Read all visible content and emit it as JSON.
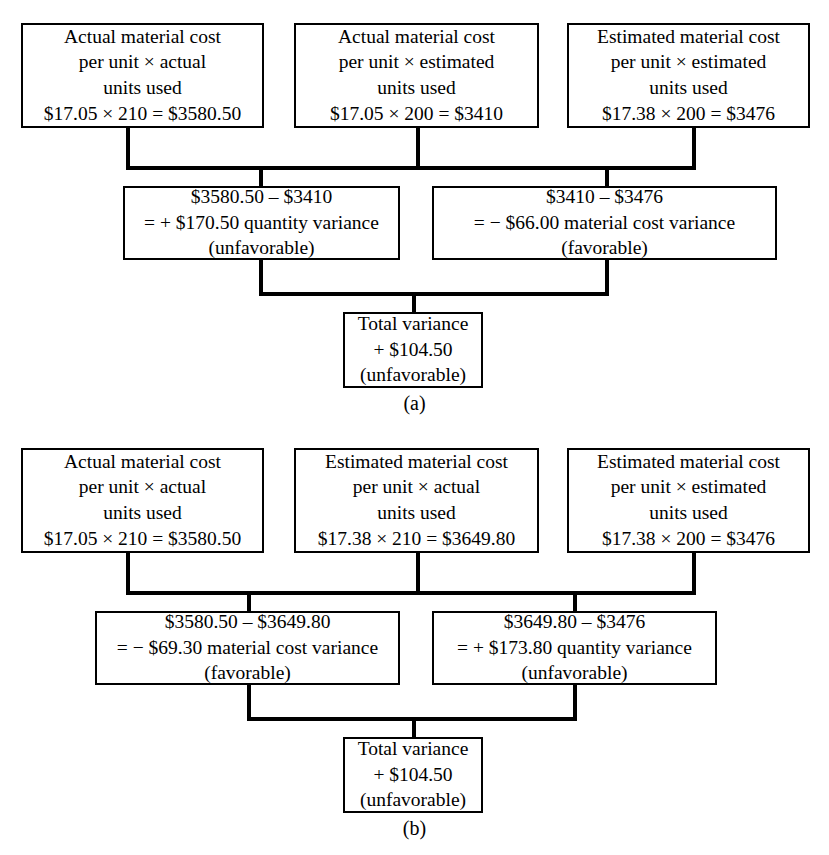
{
  "figure": {
    "panels": [
      {
        "id": "a",
        "label": "(a)",
        "top_row": [
          {
            "name": "actual-cost-actual-units",
            "lines": [
              "Actual material cost",
              "per unit × actual",
              "units used",
              "$17.05 × 210 = $3580.50"
            ]
          },
          {
            "name": "actual-cost-estimated-units",
            "lines": [
              "Actual material cost",
              "per unit × estimated",
              "units used",
              "$17.05 × 200 = $3410"
            ]
          },
          {
            "name": "estimated-cost-estimated-units",
            "lines": [
              "Estimated material cost",
              "per unit × estimated",
              "units used",
              "$17.38 × 200 = $3476"
            ]
          }
        ],
        "middle_row": [
          {
            "name": "quantity-variance",
            "lines": [
              "$3580.50 – $3410",
              "= + $170.50 quantity variance",
              "(unfavorable)"
            ]
          },
          {
            "name": "material-cost-variance",
            "lines": [
              "$3410 – $3476",
              "= − $66.00 material cost variance",
              "(favorable)"
            ]
          }
        ],
        "total": {
          "name": "total-variance",
          "lines": [
            "Total variance",
            "+ $104.50",
            "(unfavorable)"
          ]
        }
      },
      {
        "id": "b",
        "label": "(b)",
        "top_row": [
          {
            "name": "actual-cost-actual-units",
            "lines": [
              "Actual material cost",
              "per unit × actual",
              "units used",
              "$17.05 × 210 = $3580.50"
            ]
          },
          {
            "name": "estimated-cost-actual-units",
            "lines": [
              "Estimated material cost",
              "per unit × actual",
              "units used",
              "$17.38 × 210 = $3649.80"
            ]
          },
          {
            "name": "estimated-cost-estimated-units",
            "lines": [
              "Estimated material cost",
              "per unit × estimated",
              "units used",
              "$17.38 × 200 = $3476"
            ]
          }
        ],
        "middle_row": [
          {
            "name": "material-cost-variance",
            "lines": [
              "$3580.50 – $3649.80",
              "= − $69.30 material cost variance",
              "(favorable)"
            ]
          },
          {
            "name": "quantity-variance",
            "lines": [
              "$3649.80 – $3476",
              "= + $173.80 quantity variance",
              "(unfavorable)"
            ]
          }
        ],
        "total": {
          "name": "total-variance",
          "lines": [
            "Total variance",
            "+ $104.50",
            "(unfavorable)"
          ]
        }
      }
    ],
    "colors": {
      "line": "#000000",
      "background": "#ffffff",
      "text": "#000000"
    }
  }
}
